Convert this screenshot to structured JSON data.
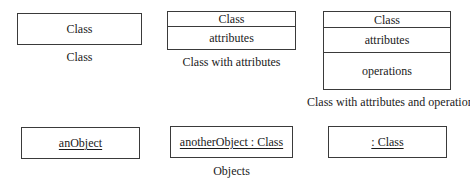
{
  "diagram": {
    "type": "uml-notation-reference",
    "class_examples": [
      {
        "id": "class",
        "compartments": [
          "Class"
        ],
        "caption": "Class"
      },
      {
        "id": "class-with-attributes",
        "compartments": [
          "Class",
          "attributes"
        ],
        "caption": "Class with attributes"
      },
      {
        "id": "class-with-attributes-and-operations",
        "compartments": [
          "Class",
          "attributes",
          "operations"
        ],
        "caption": "Class with attributes and operations"
      }
    ],
    "object_examples": [
      {
        "id": "named-object",
        "label": "anObject"
      },
      {
        "id": "named-typed-object",
        "label": "anotherObject : Class"
      },
      {
        "id": "anonymous-object",
        "label": ": Class"
      }
    ],
    "objects_caption": "Objects",
    "colors": {
      "stroke": "#3a3a3a",
      "text": "#1a1a1a",
      "background": "#ffffff"
    }
  }
}
